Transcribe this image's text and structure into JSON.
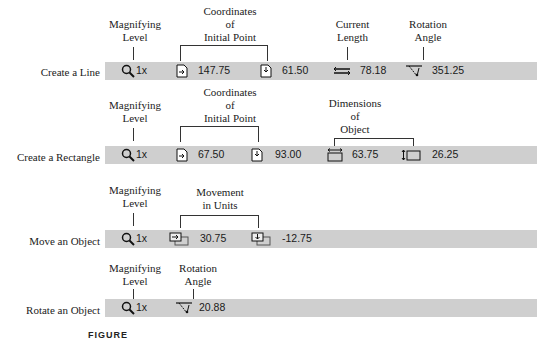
{
  "rows": [
    {
      "label": "Create a Line",
      "zoom": "1x",
      "values": {
        "x": "147.75",
        "y": "61.50",
        "length": "78.18",
        "angle": "351.25"
      },
      "annotations": {
        "magnify": [
          "Magnifying",
          "Level"
        ],
        "coords": [
          "Coordinates",
          "of",
          "Initial Point"
        ],
        "length": [
          "Current",
          "Length"
        ],
        "angle": [
          "Rotation",
          "Angle"
        ]
      }
    },
    {
      "label": "Create a Rectangle",
      "zoom": "1x",
      "values": {
        "x": "67.50",
        "y": "93.00",
        "width": "63.75",
        "height": "26.25"
      },
      "annotations": {
        "magnify": [
          "Magnifying",
          "Level"
        ],
        "coords": [
          "Coordinates",
          "of",
          "Initial Point"
        ],
        "dims": [
          "Dimensions",
          "of",
          "Object"
        ]
      }
    },
    {
      "label": "Move an Object",
      "zoom": "1x",
      "values": {
        "dx": "30.75",
        "dy": "-12.75"
      },
      "annotations": {
        "magnify": [
          "Magnifying",
          "Level"
        ],
        "move": [
          "Movement",
          "in Units"
        ]
      }
    },
    {
      "label": "Rotate an Object",
      "zoom": "1x",
      "values": {
        "angle": "20.88"
      },
      "annotations": {
        "magnify": [
          "Magnifying",
          "Level"
        ],
        "angle": [
          "Rotation",
          "Angle"
        ]
      }
    }
  ],
  "caption": "FIGURE"
}
